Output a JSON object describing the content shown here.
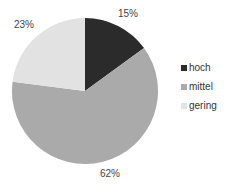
{
  "chart_data": {
    "type": "pie",
    "title": "",
    "categories": [
      "hoch",
      "mittel",
      "gering"
    ],
    "values": [
      15,
      62,
      23
    ],
    "labels": [
      "15%",
      "62%",
      "23%"
    ],
    "colors": [
      "#2b2b2b",
      "#aaaaaa",
      "#e2e2e2"
    ],
    "legend_position": "right",
    "start_angle": "12 o'clock, clockwise"
  },
  "labels": {
    "hoch": "15%",
    "mittel": "62%",
    "gering": "23%"
  },
  "legend": [
    {
      "label": "hoch",
      "color": "#2b2b2b"
    },
    {
      "label": "mittel",
      "color": "#aaaaaa"
    },
    {
      "label": "gering",
      "color": "#e2e2e2"
    }
  ]
}
